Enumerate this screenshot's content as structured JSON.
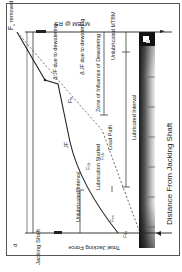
{
  "figure": {
    "panel_label": "d",
    "rotation_deg": 90,
    "x_axis_label": "Distance From Jacking Shaft",
    "y_axis_label": "Total Jacking Force",
    "left_marker": "Jacking Shaft",
    "right_marker": "MTBM @ RS",
    "labels": {
      "f_removed": "F",
      "f_removed_sub": "s",
      "f_removed_note": "removed at RS",
      "djf_dewatering_1": "Δ JF due to dewatering",
      "djf_dewatering_2": "Δ JF due to dewatering",
      "zone_influence": "Zone of Influence of Dewatering",
      "unlubricated_mtbm": "Unlubricated MTBM",
      "lubricated_interval": "Lubricated Interval",
      "load_path": "Load Path",
      "f_fp": "F",
      "f_fp_sub": "fp",
      "jf": "JF",
      "f_ub": "F",
      "f_ub_sub": "Ub",
      "f_ub2": "F",
      "f_ub2_sub": "Ub",
      "lubrication_started": "Lubrication Started",
      "unlubricated_interval": "Unlubricated Interval",
      "f_sn": "F",
      "f_sn_sub": "sn",
      "f_ss": "F",
      "f_ss_sub": "Ss"
    },
    "colors": {
      "line": "#222222",
      "dashed": "#555555",
      "pipe_dark": "#1a1a1a",
      "pipe_light": "#e0e0e0"
    }
  }
}
